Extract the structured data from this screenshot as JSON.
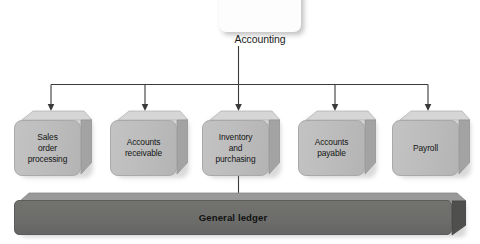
{
  "diagram": {
    "type": "hierarchy-flow",
    "colors": {
      "background": "#ffffff",
      "module_face": "#bdbdbd",
      "module_top": "#d6d6d6",
      "module_side": "#a0a0a0",
      "ledger_bar": "#6d6d6b",
      "ledger_top": "#8f8f8d",
      "connector": "#3a3a3a",
      "text": "#141414",
      "top_node_fill": "#fdfdfd"
    },
    "top_node": {
      "label": "Accounting",
      "shape": "rounded-rectangle",
      "fill": "#fdfdfd"
    },
    "modules": [
      {
        "id": "sales-order-processing",
        "label": "Sales\norder\nprocessing",
        "lines": [
          "Sales",
          "order",
          "processing"
        ]
      },
      {
        "id": "accounts-receivable",
        "label": "Accounts\nreceivable",
        "lines": [
          "Accounts",
          "receivable"
        ]
      },
      {
        "id": "inventory-and-purchasing",
        "label": "Inventory\nand\npurchasing",
        "lines": [
          "Inventory",
          "and",
          "purchasing"
        ]
      },
      {
        "id": "accounts-payable",
        "label": "Accounts\npayable",
        "lines": [
          "Accounts",
          "payable"
        ]
      },
      {
        "id": "payroll",
        "label": "Payroll",
        "lines": [
          "Payroll"
        ]
      }
    ],
    "ledger": {
      "label": "General ledger",
      "shape": "3d-bar"
    },
    "connectors": {
      "from_top_node_to_bus": true,
      "bus_feeds_all_modules": true,
      "from_module_to_ledger": "inventory-and-purchasing"
    }
  }
}
